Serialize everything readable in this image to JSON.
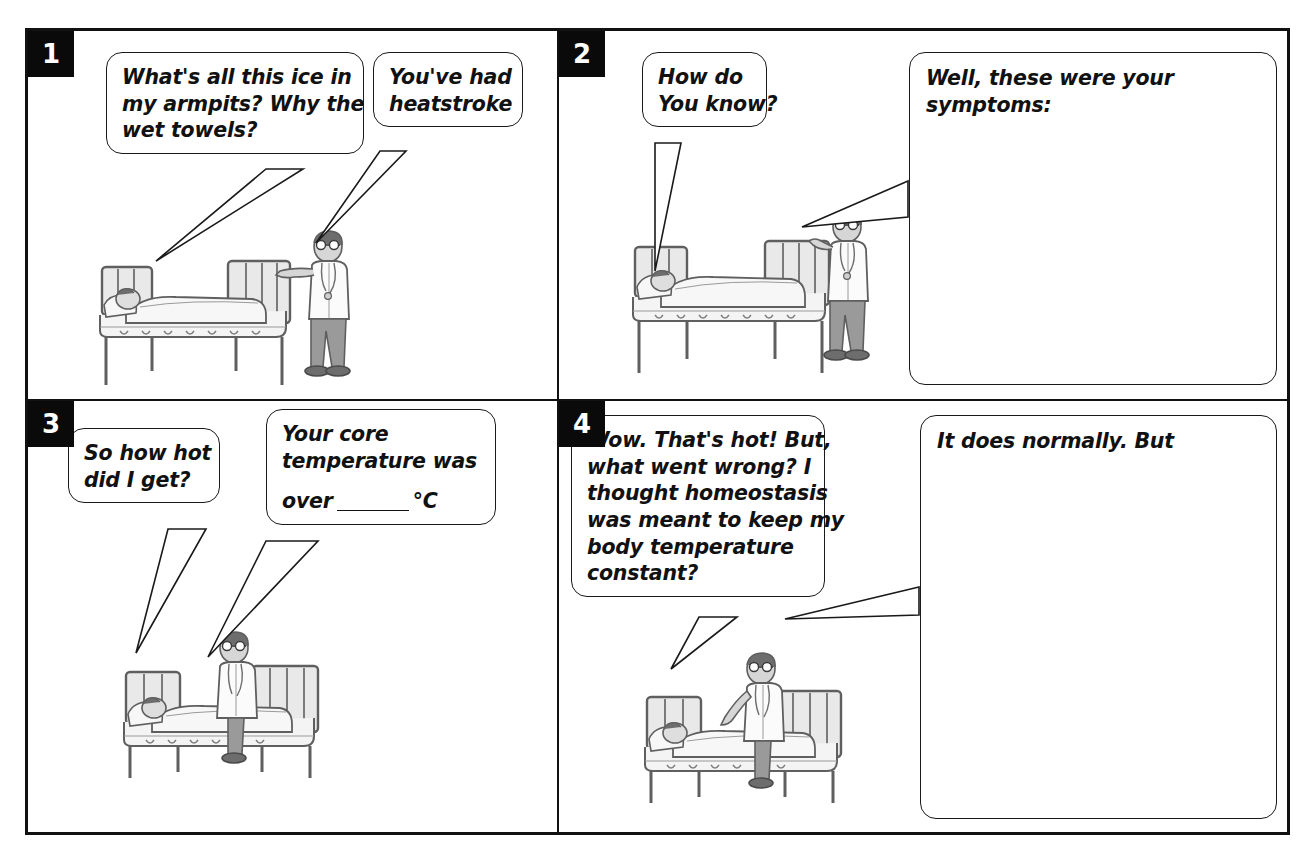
{
  "document": {
    "type": "comic-worksheet",
    "panel_count": 4
  },
  "panels": [
    {
      "number": "1",
      "bubbles": [
        {
          "name": "patient-question",
          "lines": [
            "What's all this ice in",
            "my armpits? Why the",
            "wet towels?"
          ]
        },
        {
          "name": "doctor-answer",
          "lines": [
            "You've had",
            "heatstroke"
          ]
        }
      ],
      "scene": {
        "name": "patient-lying-in-bed-with-standing-doctor",
        "characters": [
          "patient-lying-in-bed",
          "doctor-standing-pointing"
        ]
      }
    },
    {
      "number": "2",
      "bubbles": [
        {
          "name": "patient-question",
          "lines": [
            "How do",
            "You know?"
          ]
        },
        {
          "name": "doctor-answer-box",
          "lines": [
            "Well, these were your",
            "symptoms:"
          ]
        }
      ],
      "scene": {
        "name": "patient-lying-in-bed-with-doctor-at-bedrail",
        "characters": [
          "patient-lying-in-bed",
          "doctor-standing-holding-bedrail"
        ]
      }
    },
    {
      "number": "3",
      "bubbles": [
        {
          "name": "patient-question",
          "lines": [
            "So how hot",
            "did I get?"
          ]
        },
        {
          "name": "doctor-answer",
          "lines": [
            "Your core",
            "temperature was"
          ],
          "blank_line": {
            "before": "over",
            "after": "°C"
          }
        }
      ],
      "scene": {
        "name": "patient-lying-in-bed-with-doctor-seated",
        "characters": [
          "patient-lying-in-bed",
          "doctor-seated-on-bed"
        ]
      }
    },
    {
      "number": "4",
      "bubbles": [
        {
          "name": "patient-question",
          "lines": [
            "Wow. That's hot! But,",
            "what went wrong? I",
            "thought homeostasis",
            "was meant to keep my",
            "body temperature",
            "constant?"
          ]
        },
        {
          "name": "doctor-answer-box",
          "lines": [
            "It does normally. But"
          ]
        }
      ],
      "scene": {
        "name": "patient-lying-in-bed-with-doctor-seated",
        "characters": [
          "patient-lying-in-bed",
          "doctor-seated-on-bed-pointing"
        ]
      }
    }
  ],
  "colors": {
    "ink": "#111111",
    "paper": "#ffffff",
    "badge_bg": "#0a0a0a",
    "badge_fg": "#ffffff",
    "figure_grey": "#7d7d7d",
    "figure_light": "#c9c9c9"
  }
}
